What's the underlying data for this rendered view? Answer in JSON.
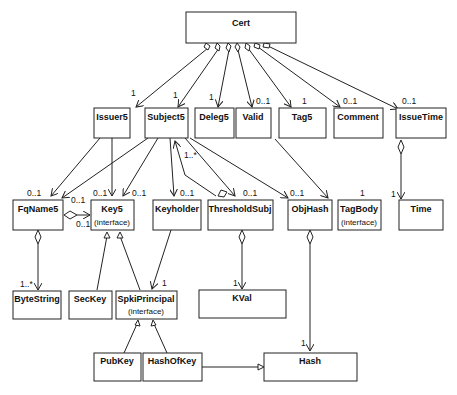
{
  "diagram": {
    "type": "UML class diagram",
    "classes": {
      "cert": {
        "name": "Cert"
      },
      "issuer5": {
        "name": "Issuer5"
      },
      "subject5": {
        "name": "Subject5"
      },
      "deleg5": {
        "name": "Deleg5"
      },
      "valid": {
        "name": "Valid"
      },
      "tag5": {
        "name": "Tag5"
      },
      "comment": {
        "name": "Comment"
      },
      "issuetime": {
        "name": "IssueTime"
      },
      "fqname5": {
        "name": "FqName5"
      },
      "key5": {
        "name": "Key5",
        "stereotype": "(interface)"
      },
      "keyholder": {
        "name": "Keyholder"
      },
      "thresholdsubj": {
        "name": "ThresholdSubj"
      },
      "objhash": {
        "name": "ObjHash"
      },
      "tagbody": {
        "name": "TagBody",
        "stereotype": "(interface)"
      },
      "time": {
        "name": "Time"
      },
      "bytestring": {
        "name": "ByteString"
      },
      "seckey": {
        "name": "SecKey"
      },
      "spkiprincipal": {
        "name": "SpkiPrincipal",
        "stereotype": "(interface)"
      },
      "kval": {
        "name": "KVal"
      },
      "pubkey": {
        "name": "PubKey"
      },
      "hashofkey": {
        "name": "HashOfKey"
      },
      "hash": {
        "name": "Hash"
      }
    },
    "multiplicities": {
      "cert_issuer5": "1",
      "cert_subject5": "1",
      "cert_deleg5": "1",
      "cert_valid": "0..1",
      "cert_tag5": "1",
      "cert_comment": "0..1",
      "cert_issuetime": "0..1",
      "issuer5_fqname5": "0..1",
      "issuer5_key5": "0..1",
      "subject5_fqname5": "0..1",
      "subject5_key5": "0..1",
      "subject5_keyholder": "0..1",
      "subject5_thresholdsubj": "0..1",
      "subject5_objhash": "0..1",
      "thresholdsubj_subject5": "1..*",
      "fqname5_key5": "0..1",
      "fqname5_bytestring": "1..*",
      "keyholder_spkiprincipal": "1",
      "thresholdsubj_kval": "1",
      "objhash_hash": "1",
      "tag5_tagbody": "1",
      "issuetime_time": "1"
    }
  }
}
